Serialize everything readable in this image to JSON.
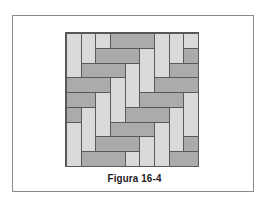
{
  "figure": {
    "caption": "Figura 16-4",
    "grid_size": 9,
    "colors": {
      "light": "#dadada",
      "dark": "#ababab",
      "line": "#5a5a5a",
      "frame": "#8a8a8a"
    },
    "tiles": [
      {
        "c": 0,
        "r": 0,
        "w": 1,
        "h": 3,
        "tone": "light"
      },
      {
        "c": 1,
        "r": 0,
        "w": 1,
        "h": 2,
        "tone": "light"
      },
      {
        "c": 2,
        "r": 0,
        "w": 1,
        "h": 1,
        "tone": "light"
      },
      {
        "c": 3,
        "r": 0,
        "w": 3,
        "h": 1,
        "tone": "dark"
      },
      {
        "c": 6,
        "r": 0,
        "w": 1,
        "h": 3,
        "tone": "light"
      },
      {
        "c": 7,
        "r": 0,
        "w": 1,
        "h": 2,
        "tone": "light"
      },
      {
        "c": 8,
        "r": 0,
        "w": 1,
        "h": 1,
        "tone": "light"
      },
      {
        "c": 2,
        "r": 1,
        "w": 3,
        "h": 1,
        "tone": "dark"
      },
      {
        "c": 5,
        "r": 1,
        "w": 1,
        "h": 3,
        "tone": "light"
      },
      {
        "c": 8,
        "r": 1,
        "w": 1,
        "h": 1,
        "tone": "dark"
      },
      {
        "c": 1,
        "r": 2,
        "w": 3,
        "h": 1,
        "tone": "dark"
      },
      {
        "c": 4,
        "r": 2,
        "w": 1,
        "h": 3,
        "tone": "light"
      },
      {
        "c": 7,
        "r": 2,
        "w": 2,
        "h": 1,
        "tone": "dark"
      },
      {
        "c": 0,
        "r": 3,
        "w": 3,
        "h": 1,
        "tone": "dark"
      },
      {
        "c": 3,
        "r": 3,
        "w": 1,
        "h": 3,
        "tone": "light"
      },
      {
        "c": 6,
        "r": 3,
        "w": 3,
        "h": 1,
        "tone": "dark"
      },
      {
        "c": 0,
        "r": 4,
        "w": 2,
        "h": 1,
        "tone": "dark"
      },
      {
        "c": 2,
        "r": 4,
        "w": 1,
        "h": 3,
        "tone": "light"
      },
      {
        "c": 5,
        "r": 4,
        "w": 3,
        "h": 1,
        "tone": "dark"
      },
      {
        "c": 8,
        "r": 4,
        "w": 1,
        "h": 3,
        "tone": "light"
      },
      {
        "c": 0,
        "r": 5,
        "w": 1,
        "h": 1,
        "tone": "dark"
      },
      {
        "c": 1,
        "r": 5,
        "w": 1,
        "h": 3,
        "tone": "light"
      },
      {
        "c": 4,
        "r": 5,
        "w": 3,
        "h": 1,
        "tone": "dark"
      },
      {
        "c": 7,
        "r": 5,
        "w": 1,
        "h": 3,
        "tone": "light"
      },
      {
        "c": 0,
        "r": 6,
        "w": 1,
        "h": 3,
        "tone": "light"
      },
      {
        "c": 3,
        "r": 6,
        "w": 3,
        "h": 1,
        "tone": "dark"
      },
      {
        "c": 6,
        "r": 6,
        "w": 1,
        "h": 3,
        "tone": "light"
      },
      {
        "c": 2,
        "r": 7,
        "w": 3,
        "h": 1,
        "tone": "dark"
      },
      {
        "c": 5,
        "r": 7,
        "w": 1,
        "h": 2,
        "tone": "light"
      },
      {
        "c": 8,
        "r": 7,
        "w": 1,
        "h": 1,
        "tone": "dark"
      },
      {
        "c": 1,
        "r": 8,
        "w": 3,
        "h": 1,
        "tone": "dark"
      },
      {
        "c": 4,
        "r": 8,
        "w": 1,
        "h": 1,
        "tone": "light"
      },
      {
        "c": 7,
        "r": 8,
        "w": 2,
        "h": 1,
        "tone": "dark"
      }
    ]
  }
}
